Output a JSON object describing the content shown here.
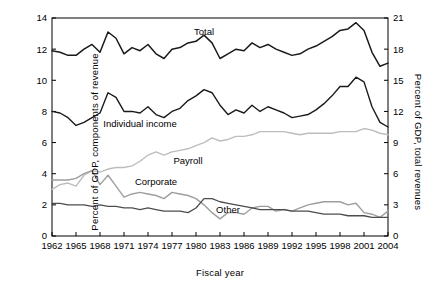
{
  "chart_data": {
    "type": "line",
    "title": "",
    "xlabel": "Fiscal year",
    "ylabel_left": "Percent of GDP, components of revenue",
    "ylabel_right": "Percent of GDP, total revenues",
    "xlim": [
      1962,
      2004
    ],
    "ylim_left": [
      0,
      14
    ],
    "ylim_right": [
      0,
      21
    ],
    "grid": false,
    "legend_position": "inline-annotations",
    "xticks": [
      1962,
      1965,
      1968,
      1971,
      1974,
      1977,
      1980,
      1983,
      1986,
      1989,
      1992,
      1995,
      1998,
      2001,
      2004
    ],
    "yticks_left": [
      0,
      2,
      4,
      6,
      8,
      10,
      12,
      14
    ],
    "yticks_right": [
      0,
      3,
      6,
      9,
      12,
      15,
      18,
      21
    ],
    "annotations": [
      {
        "text": "Total",
        "x": 1981,
        "y_left": 12.9
      },
      {
        "text": "Individual income",
        "x": 1973,
        "y_left": 7.0
      },
      {
        "text": "Payroll",
        "x": 1979,
        "y_left": 4.6
      },
      {
        "text": "Corporate",
        "x": 1975,
        "y_left": 3.3
      },
      {
        "text": "Other",
        "x": 1984,
        "y_left": 1.5
      }
    ],
    "x": [
      1962,
      1963,
      1964,
      1965,
      1966,
      1967,
      1968,
      1969,
      1970,
      1971,
      1972,
      1973,
      1974,
      1975,
      1976,
      1977,
      1978,
      1979,
      1980,
      1981,
      1982,
      1983,
      1984,
      1985,
      1986,
      1987,
      1988,
      1989,
      1990,
      1991,
      1992,
      1993,
      1994,
      1995,
      1996,
      1997,
      1998,
      1999,
      2000,
      2001,
      2002,
      2003,
      2004
    ],
    "series": [
      {
        "name": "Total",
        "axis": "right",
        "values_left_scale": [
          11.9,
          11.8,
          11.6,
          11.6,
          12.0,
          12.3,
          11.8,
          13.1,
          12.7,
          11.7,
          12.1,
          11.9,
          12.3,
          11.7,
          11.4,
          12.0,
          12.1,
          12.4,
          12.5,
          12.9,
          12.4,
          11.4,
          11.7,
          12.0,
          11.9,
          12.4,
          12.1,
          12.3,
          12.0,
          11.8,
          11.6,
          11.7,
          12.0,
          12.2,
          12.5,
          12.8,
          13.2,
          13.3,
          13.7,
          13.2,
          11.8,
          10.9,
          11.1
        ],
        "color": "#1a1a1a",
        "linewidth": 1.5
      },
      {
        "name": "Individual income",
        "axis": "left",
        "values": [
          8.0,
          7.9,
          7.6,
          7.1,
          7.3,
          7.6,
          7.9,
          9.2,
          8.9,
          8.0,
          8.0,
          7.9,
          8.3,
          7.8,
          7.6,
          8.0,
          8.2,
          8.7,
          9.0,
          9.4,
          9.2,
          8.4,
          7.8,
          8.1,
          7.9,
          8.4,
          8.0,
          8.3,
          8.1,
          7.9,
          7.6,
          7.7,
          7.8,
          8.1,
          8.5,
          9.0,
          9.6,
          9.6,
          10.2,
          9.9,
          8.3,
          7.3,
          7.0
        ],
        "color": "#1a1a1a",
        "linewidth": 1.4
      },
      {
        "name": "Payroll",
        "axis": "left",
        "values": [
          3.0,
          3.3,
          3.4,
          3.2,
          3.9,
          4.2,
          4.1,
          4.3,
          4.4,
          4.4,
          4.5,
          4.8,
          5.2,
          5.4,
          5.2,
          5.4,
          5.5,
          5.6,
          5.8,
          6.0,
          6.3,
          6.1,
          6.2,
          6.4,
          6.4,
          6.5,
          6.7,
          6.7,
          6.7,
          6.7,
          6.6,
          6.5,
          6.6,
          6.6,
          6.6,
          6.6,
          6.7,
          6.7,
          6.7,
          6.9,
          6.8,
          6.6,
          6.5
        ],
        "color": "#bdbdbd",
        "linewidth": 1.4
      },
      {
        "name": "Corporate",
        "axis": "left",
        "values": [
          3.6,
          3.6,
          3.6,
          3.7,
          4.0,
          4.2,
          3.3,
          3.9,
          3.2,
          2.5,
          2.7,
          2.8,
          2.7,
          2.6,
          2.4,
          2.8,
          2.7,
          2.6,
          2.4,
          2.0,
          1.5,
          1.1,
          1.5,
          1.5,
          1.4,
          1.8,
          1.9,
          1.9,
          1.6,
          1.7,
          1.6,
          1.8,
          2.0,
          2.1,
          2.2,
          2.2,
          2.2,
          2.0,
          2.1,
          1.5,
          1.4,
          1.2,
          1.6
        ],
        "color": "#9e9e9e",
        "linewidth": 1.4
      },
      {
        "name": "Other",
        "axis": "left",
        "values": [
          2.1,
          2.1,
          2.0,
          2.0,
          2.0,
          1.9,
          2.0,
          1.9,
          1.9,
          1.8,
          1.8,
          1.7,
          1.8,
          1.7,
          1.6,
          1.6,
          1.6,
          1.5,
          1.8,
          2.4,
          2.4,
          2.2,
          2.1,
          2.0,
          1.9,
          1.8,
          1.7,
          1.7,
          1.7,
          1.7,
          1.6,
          1.6,
          1.6,
          1.5,
          1.4,
          1.4,
          1.4,
          1.3,
          1.3,
          1.3,
          1.2,
          1.2,
          1.2
        ],
        "color": "#4d4d4d",
        "linewidth": 1.3
      }
    ]
  }
}
